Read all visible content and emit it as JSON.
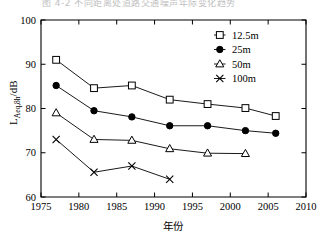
{
  "caption": {
    "text": "图 4-2  不同距离处道路交通噪声年际变化趋势",
    "visible_fragment": true
  },
  "axes": {
    "y_title_main": "L",
    "y_title_sub": "Aeq,8h",
    "y_title_unit": "/dB",
    "y_title_full": "LAeq,8h/dB",
    "x_title": "年份",
    "x_ticks": [
      "1975",
      "1980",
      "1985",
      "1990",
      "1995",
      "2000",
      "2005",
      "2010"
    ],
    "y_ticks": [
      "60",
      "70",
      "80",
      "90",
      "100"
    ]
  },
  "legend": {
    "items": [
      {
        "label": "12.5m",
        "marker": "open-square"
      },
      {
        "label": "25m",
        "marker": "filled-circle"
      },
      {
        "label": "50m",
        "marker": "open-triangle"
      },
      {
        "label": "100m",
        "marker": "cross-x"
      }
    ]
  },
  "chart_data": {
    "type": "line",
    "title": "图 4-2  不同距离处道路交通噪声年际变化趋势",
    "xlabel": "年份",
    "ylabel": "LAeq,8h/dB",
    "xlim": [
      1975,
      2010
    ],
    "ylim": [
      60,
      100
    ],
    "xticks": [
      1975,
      1980,
      1985,
      1990,
      1995,
      2000,
      2005,
      2010
    ],
    "yticks": [
      60,
      70,
      80,
      90,
      100
    ],
    "grid": false,
    "legend_position": "top-right",
    "series": [
      {
        "name": "12.5m",
        "marker": "open-square",
        "x": [
          1977,
          1982,
          1987,
          1992,
          1997,
          2002,
          2006
        ],
        "values": [
          91.0,
          84.6,
          85.2,
          82.0,
          81.0,
          80.1,
          78.3
        ]
      },
      {
        "name": "25m",
        "marker": "filled-circle",
        "x": [
          1977,
          1982,
          1987,
          1992,
          1997,
          2002,
          2006
        ],
        "values": [
          85.2,
          79.5,
          78.1,
          76.1,
          76.1,
          75.0,
          74.4
        ]
      },
      {
        "name": "50m",
        "marker": "open-triangle",
        "x": [
          1977,
          1982,
          1987,
          1992,
          1997,
          2002
        ],
        "values": [
          79.0,
          73.0,
          72.8,
          70.9,
          69.9,
          69.8
        ]
      },
      {
        "name": "100m",
        "marker": "cross-x",
        "x": [
          1977,
          1982,
          1987,
          1992
        ],
        "values": [
          73.0,
          65.6,
          67.0,
          64.0
        ]
      }
    ]
  }
}
